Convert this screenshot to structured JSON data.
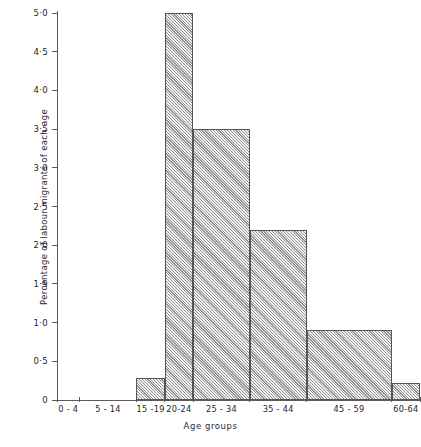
{
  "chart_data": {
    "type": "bar",
    "title": "",
    "xlabel": "Age groups",
    "ylabel": "Percentage of labour migrants of each age",
    "categories": [
      "0 - 4",
      "5 - 14",
      "15 -19",
      "20-24",
      "25 - 34",
      "35 - 44",
      "45 - 59",
      "60-64"
    ],
    "values": [
      0,
      0,
      0.28,
      5.0,
      3.5,
      2.2,
      0.9,
      0.22
    ],
    "bin_edges": [
      0,
      4,
      14,
      19,
      24,
      34,
      44,
      59,
      64
    ],
    "ylim": [
      0,
      5.0
    ],
    "ytick_values": [
      0,
      0.5,
      1.0,
      1.5,
      2.0,
      2.5,
      3.0,
      3.5,
      4.0,
      4.5,
      5.0
    ],
    "ytick_labels": [
      "0",
      "0·5",
      "1·0",
      "1·5",
      "2·0",
      "2·5",
      "3·0",
      "3·5",
      "4·0",
      "4·5",
      "5·0"
    ],
    "grid": false,
    "legend": null,
    "bar_fill": "diagonal-hatch",
    "bar_edge_color": "#555555",
    "axis_color": "#5a5a5a"
  }
}
